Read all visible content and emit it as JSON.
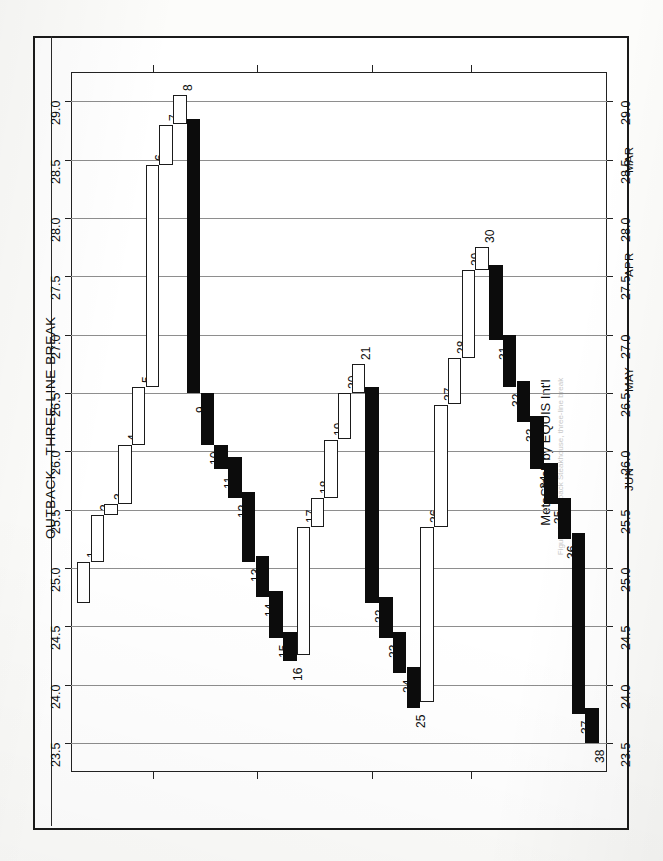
{
  "page": {
    "title": "OUTBACK—THREE-LINE BREAK",
    "vendor": "MetaStock by EQUIS Int'l",
    "caption_faint": "Figure 12-4  Outback Steakhouse, three-line break"
  },
  "chart_data": {
    "type": "bar",
    "title": "OUTBACK—THREE-LINE BREAK",
    "subtitle": "MetaStock by EQUIS Int'l",
    "orientation": "rotated-90-ccw",
    "xlabel": "",
    "ylabel": "",
    "ylim": [
      23.25,
      29.25
    ],
    "grid": true,
    "legend": "none",
    "yticks": [
      "29.0",
      "28.5",
      "28.0",
      "27.5",
      "27.0",
      "26.5",
      "26.0",
      "25.5",
      "25.0",
      "24.5",
      "24.0",
      "23.5"
    ],
    "ytick_values": [
      29.0,
      28.5,
      28.0,
      27.5,
      27.0,
      26.5,
      26.0,
      25.5,
      25.0,
      24.5,
      24.0,
      23.5
    ],
    "xticks": [
      "MAR",
      "APR",
      "MAY",
      "JUN"
    ],
    "xtick_positions": [
      0.145,
      0.345,
      0.565,
      0.755
    ],
    "categories": [
      "1",
      "2",
      "3",
      "4",
      "5",
      "6",
      "7",
      "8",
      "9",
      "10",
      "11",
      "12",
      "13",
      "14",
      "15",
      "16",
      "17",
      "18",
      "19",
      "20",
      "21",
      "22",
      "23",
      "24",
      "25",
      "26",
      "27",
      "28",
      "29",
      "30",
      "31",
      "32",
      "33",
      "34",
      "35",
      "36",
      "37",
      "38"
    ],
    "blocks": [
      {
        "n": "1",
        "dir": "down",
        "low": 24.7,
        "high": 25.05
      },
      {
        "n": "2",
        "dir": "down",
        "low": 25.05,
        "high": 25.45
      },
      {
        "n": "3",
        "dir": "down",
        "low": 25.45,
        "high": 25.55
      },
      {
        "n": "4",
        "dir": "down",
        "low": 25.55,
        "high": 26.05
      },
      {
        "n": "5",
        "dir": "down",
        "low": 26.05,
        "high": 26.55
      },
      {
        "n": "6",
        "dir": "down",
        "low": 26.55,
        "high": 28.45
      },
      {
        "n": "7",
        "dir": "down",
        "low": 28.45,
        "high": 28.8
      },
      {
        "n": "8",
        "dir": "down",
        "low": 28.8,
        "high": 29.05
      },
      {
        "n": "9",
        "dir": "up",
        "low": 26.5,
        "high": 28.85
      },
      {
        "n": "10",
        "dir": "up",
        "low": 26.05,
        "high": 26.5
      },
      {
        "n": "11",
        "dir": "up",
        "low": 25.85,
        "high": 26.05
      },
      {
        "n": "12",
        "dir": "up",
        "low": 25.6,
        "high": 25.95
      },
      {
        "n": "13",
        "dir": "up",
        "low": 25.05,
        "high": 25.65
      },
      {
        "n": "14",
        "dir": "up",
        "low": 24.75,
        "high": 25.1
      },
      {
        "n": "15",
        "dir": "up",
        "low": 24.4,
        "high": 24.8
      },
      {
        "n": "16",
        "dir": "up",
        "low": 24.2,
        "high": 24.45
      },
      {
        "n": "17",
        "dir": "down",
        "low": 24.25,
        "high": 25.35
      },
      {
        "n": "18",
        "dir": "down",
        "low": 25.35,
        "high": 25.6
      },
      {
        "n": "19",
        "dir": "down",
        "low": 25.6,
        "high": 26.1
      },
      {
        "n": "20",
        "dir": "down",
        "low": 26.1,
        "high": 26.5
      },
      {
        "n": "21",
        "dir": "down",
        "low": 26.5,
        "high": 26.75
      },
      {
        "n": "22",
        "dir": "up",
        "low": 24.7,
        "high": 26.55
      },
      {
        "n": "23",
        "dir": "up",
        "low": 24.4,
        "high": 24.75
      },
      {
        "n": "24",
        "dir": "up",
        "low": 24.1,
        "high": 24.45
      },
      {
        "n": "25",
        "dir": "up",
        "low": 23.8,
        "high": 24.15
      },
      {
        "n": "26",
        "dir": "down",
        "low": 23.85,
        "high": 25.35
      },
      {
        "n": "27",
        "dir": "down",
        "low": 25.35,
        "high": 26.4
      },
      {
        "n": "28",
        "dir": "down",
        "low": 26.4,
        "high": 26.8
      },
      {
        "n": "29",
        "dir": "down",
        "low": 26.8,
        "high": 27.55
      },
      {
        "n": "30",
        "dir": "down",
        "low": 27.55,
        "high": 27.75
      },
      {
        "n": "31",
        "dir": "up",
        "low": 26.95,
        "high": 27.6
      },
      {
        "n": "32",
        "dir": "up",
        "low": 26.55,
        "high": 27.0
      },
      {
        "n": "33",
        "dir": "up",
        "low": 26.25,
        "high": 26.6
      },
      {
        "n": "34",
        "dir": "up",
        "low": 25.85,
        "high": 26.3
      },
      {
        "n": "35",
        "dir": "up",
        "low": 25.55,
        "high": 25.9
      },
      {
        "n": "36",
        "dir": "up",
        "low": 25.25,
        "high": 25.6
      },
      {
        "n": "37",
        "dir": "up",
        "low": 23.75,
        "high": 25.3
      },
      {
        "n": "38",
        "dir": "up",
        "low": 23.5,
        "high": 23.8
      }
    ]
  }
}
